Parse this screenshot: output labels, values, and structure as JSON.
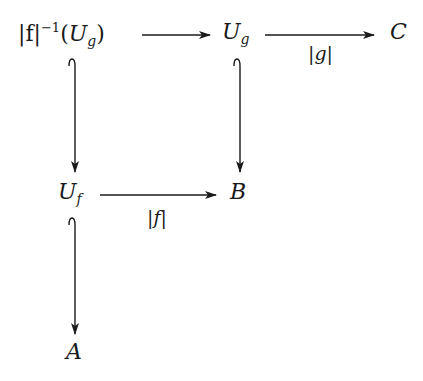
{
  "diagram": {
    "type": "commutative-diagram",
    "nodes": {
      "preimage": {
        "abs_f": "|f|",
        "exp": "−1",
        "open": "(",
        "U": "U",
        "sub": "g",
        "close": ")"
      },
      "Ug": {
        "base": "U",
        "sub": "g"
      },
      "C": {
        "label": "C"
      },
      "Uf": {
        "base": "U",
        "sub": "f"
      },
      "B": {
        "label": "B"
      },
      "A": {
        "label": "A"
      }
    },
    "edges": [
      {
        "from": "|f|^{-1}(U_g)",
        "to": "U_g",
        "label": "",
        "style": "arrow"
      },
      {
        "from": "U_g",
        "to": "C",
        "label": "|g|",
        "style": "arrow"
      },
      {
        "from": "|f|^{-1}(U_g)",
        "to": "U_f",
        "label": "",
        "style": "hook-arrow"
      },
      {
        "from": "U_g",
        "to": "B",
        "label": "",
        "style": "hook-arrow"
      },
      {
        "from": "U_f",
        "to": "B",
        "label": "|f|",
        "style": "arrow"
      },
      {
        "from": "U_f",
        "to": "A",
        "label": "",
        "style": "hook-arrow"
      }
    ],
    "labels": {
      "g_map": "|g|",
      "f_map": "|f|"
    },
    "colors": {
      "ink": "#1a1a1a",
      "background": "#ffffff"
    }
  }
}
